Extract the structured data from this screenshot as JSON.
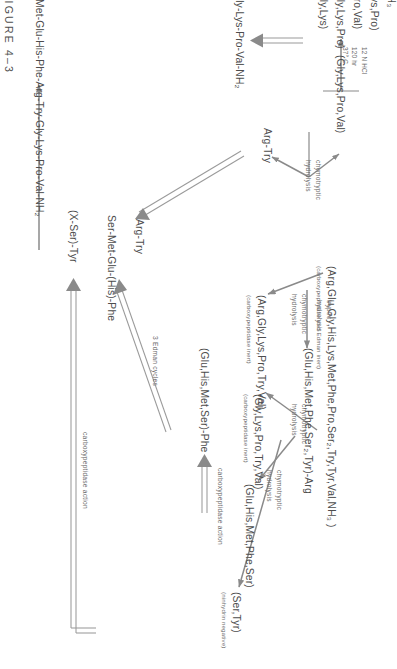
{
  "figure": {
    "caption": "FIGURE 4–3"
  },
  "nodes": {
    "parent": {
      "text": "(Arg,Glu,Gly,His,Lys,Met,Phe,Pro,Ser₂,Try,Tyr,Val,NH₃ )",
      "note": "(carboxypeptidase and  Edman inert)"
    },
    "tryptic_big": {
      "text": "(Arg,Gly,Lys,Pro,Try,Val)",
      "note": "(carboxypeptidase inert)"
    },
    "tryptic_small": {
      "text": "(Gly,Lys,Pro,Try,Val)",
      "note": "(carboxypeptidase inert)"
    },
    "glu_his_arg": {
      "text": "(Glu,His,Met,Phe,Ser₂,Tyr)-Arg",
      "note": ""
    },
    "glu_his_ser": {
      "text": "(Glu,His,Met,Phe,Ser)",
      "note": ""
    },
    "ser_tyr": {
      "text": "(Ser,Tyr)",
      "note": "(ninhydrin negative)"
    },
    "glu_his_phe": {
      "text": "(Glu,His,Met,Ser)-Phe",
      "note": ""
    },
    "gly_lys_pro_val": {
      "text": "(Gly,Lys,Pro,Val)",
      "note": ""
    },
    "arg_try_top": {
      "text": "Arg-Try",
      "note": ""
    },
    "hydrolysate_a": {
      "text": "(Gly,Lys,Pro)",
      "note": ""
    },
    "hydrolysate_b": {
      "text": "(Pro,Val)",
      "note": ""
    },
    "hydrolysate_c": {
      "text": "(Gly,Lys)",
      "note": ""
    },
    "hydrolysate_d": {
      "text": "(Lys,Pro)",
      "note": ""
    },
    "hydrolysate_e": {
      "text": "NH₃",
      "note": ""
    },
    "gly_lys_pro_val_nh2": {
      "text": "Gly-Lys-Pro-Val-NH₂",
      "note": ""
    },
    "arg_try_mid": {
      "text": "Arg-Try",
      "note": ""
    },
    "x_ser_tyr": {
      "text": "(X-Ser)-Tyr",
      "note": ""
    },
    "ser_met_glu_his_phe": {
      "text": "Ser-Met-Glu-(His)-Phe",
      "note": ""
    },
    "final": {
      "text": "X-Ser-Tyr-Ser-Met-Glu-His-Phe-Arg-Try-Gly-Lys-Pro-Val-NH₂",
      "note": ""
    }
  },
  "labels": {
    "chymotryptic_1_a": "chymotryptic",
    "chymotryptic_1_b": "hydrolysis",
    "tryptic_a": "tryptic",
    "tryptic_b": "hydrolysis",
    "chymotryptic_2_a": "chymotryptic",
    "chymotryptic_2_b": "hydrolysis",
    "chymotryptic_3_a": "chymotryptic",
    "chymotryptic_3_b": "hydrolysis",
    "carboxypeptidase_action_1": "carboxypeptidase  action",
    "carboxypeptidase_action_2": "carboxypeptidase  action",
    "edman_cycles": "3  Edman  cycles"
  },
  "conditions": {
    "acid": "12 N HCl",
    "time": "120 hr",
    "temp": "37° C"
  },
  "colors": {
    "ink": "#4d4d4d",
    "rule": "#8a8a8a",
    "paper": "#ffffff"
  }
}
